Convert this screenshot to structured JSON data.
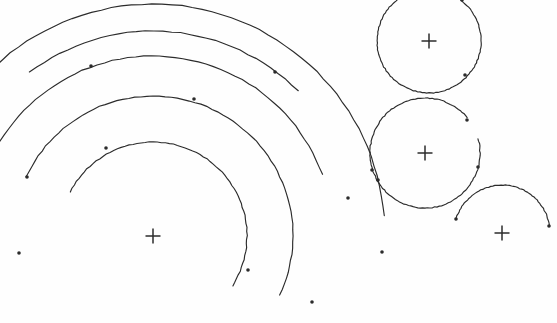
{
  "figure": {
    "background_color": "#fefefe",
    "stroke_color": "#2b2b2b",
    "stroke_width": 1.15,
    "width": 557,
    "height": 323,
    "marker_glyph": "+",
    "marker_size": 15
  },
  "centers": [
    {
      "name": "left-center",
      "label": "+",
      "x": 153,
      "y": 236
    },
    {
      "name": "top-right-center",
      "label": "+",
      "x": 429,
      "y": 41
    },
    {
      "name": "mid-right-center",
      "label": "+",
      "x": 425,
      "y": 153
    },
    {
      "name": "bottom-right-center",
      "label": "+",
      "x": 502,
      "y": 233
    }
  ],
  "arcs": [
    {
      "name": "left-arc-1-innermost",
      "center": "left-center",
      "cx": 153,
      "cy": 236,
      "radius": 94,
      "start_angle_deg": 208,
      "end_angle_deg": 392,
      "endpoint_dots": [
        [
          106,
          148
        ],
        [
          248,
          270
        ]
      ]
    },
    {
      "name": "left-arc-2",
      "center": "left-center",
      "cx": 153,
      "cy": 236,
      "radius": 140,
      "start_angle_deg": 205,
      "end_angle_deg": 385,
      "endpoint_dots": [
        [
          27,
          177
        ],
        [
          194,
          99
        ]
      ]
    },
    {
      "name": "left-arc-3",
      "center": "left-center",
      "cx": 153,
      "cy": 236,
      "radius": 180,
      "start_angle_deg": 199,
      "end_angle_deg": 340,
      "endpoint_dots": [
        [
          91,
          66
        ],
        [
          312,
          302
        ]
      ]
    },
    {
      "name": "left-arc-4-outermost",
      "center": "left-center",
      "cx": 153,
      "cy": 236,
      "radius": 232,
      "start_angle_deg": 222,
      "end_angle_deg": 355,
      "endpoint_dots": [
        [
          19,
          253
        ],
        [
          382,
          252
        ]
      ]
    },
    {
      "name": "left-arc-5-short",
      "center": "left-center",
      "cx": 153,
      "cy": 236,
      "radius": 205,
      "start_angle_deg": 233,
      "end_angle_deg": 315,
      "endpoint_dots": [
        [
          275,
          72
        ],
        [
          348,
          198
        ]
      ]
    },
    {
      "name": "top-right-circle",
      "center": "top-right-center",
      "cx": 429,
      "cy": 41,
      "radius": 52,
      "start_angle_deg": -53,
      "end_angle_deg": 268,
      "endpoint_dots": [
        [
          462,
          0
        ],
        [
          465,
          75
        ]
      ]
    },
    {
      "name": "mid-right-circle-upper-left",
      "center": "mid-right-center",
      "cx": 425,
      "cy": 153,
      "radius": 55,
      "start_angle_deg": 150,
      "end_angle_deg": 320,
      "endpoint_dots": [
        [
          378,
          180
        ],
        [
          467,
          120
        ]
      ]
    },
    {
      "name": "mid-right-circle-lower",
      "center": "mid-right-center",
      "cx": 425,
      "cy": 153,
      "radius": 55,
      "start_angle_deg": 345,
      "end_angle_deg": 510,
      "endpoint_dots": [
        [
          478,
          167
        ],
        [
          372,
          170
        ]
      ]
    },
    {
      "name": "bottom-right-arc",
      "center": "bottom-right-center",
      "cx": 502,
      "cy": 233,
      "radius": 48,
      "start_angle_deg": 196,
      "end_angle_deg": 352,
      "endpoint_dots": [
        [
          456,
          219
        ],
        [
          549,
          226
        ]
      ]
    }
  ],
  "endpoint_dot_radius": 1.8
}
